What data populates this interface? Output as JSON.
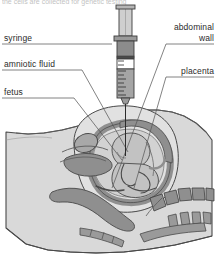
{
  "figure": {
    "top_caption": "the cells are collected for genetic testing",
    "width": 218,
    "height": 267
  },
  "labels": {
    "syringe": "syringe",
    "amniotic_fluid": "amniotic fluid",
    "fetus": "fetus",
    "abdominal_wall_line1": "abdominal",
    "abdominal_wall_line2": "wall",
    "placenta": "placenta"
  },
  "colors": {
    "background": "#ffffff",
    "body_fill": "#d9d9d9",
    "body_fill_light": "#e4e4e4",
    "organ_mid": "#b3b3b3",
    "organ_dark": "#8f8f8f",
    "uterus_wall": "#9a9a9a",
    "fetus_fill": "#c7c7c7",
    "amniotic_fill": "#cfcfcf",
    "outline": "#4a4a4a",
    "leader_line": "#5a5a5a",
    "text": "#2b2b2b",
    "syringe_barrel": "#cfcfcf",
    "syringe_plunger": "#8c8c8c",
    "syringe_fluid": "#ffffff",
    "syringe_outline": "#3d3d3d"
  },
  "syringe": {
    "name": "syringe-device",
    "graduation_marks": 9,
    "plunger_label": "plunger",
    "needle_label": "needle"
  },
  "anatomy_parts": [
    {
      "name": "abdominal-wall",
      "label": "abdominal wall"
    },
    {
      "name": "uterus-wall",
      "label": "uterus wall"
    },
    {
      "name": "amniotic-fluid",
      "label": "amniotic fluid"
    },
    {
      "name": "fetus",
      "label": "fetus"
    },
    {
      "name": "placenta",
      "label": "placenta"
    },
    {
      "name": "bladder",
      "label": "bladder"
    },
    {
      "name": "pubic-bone",
      "label": "pubic bone"
    },
    {
      "name": "spine-vertebrae",
      "label": "spine"
    },
    {
      "name": "rectum",
      "label": "rectum"
    },
    {
      "name": "sacrum",
      "label": "sacrum"
    }
  ]
}
